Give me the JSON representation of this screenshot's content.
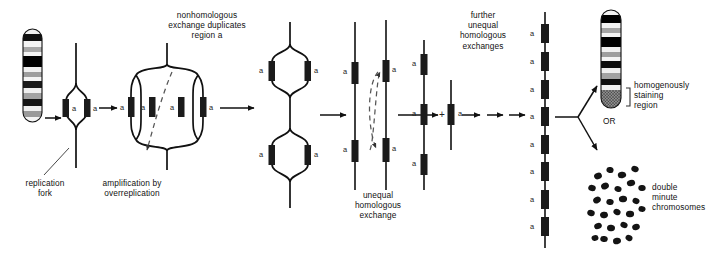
{
  "figure": {
    "type": "biology-process-diagram",
    "background": "#ffffff",
    "ink": "#000000"
  },
  "labels": {
    "replication_fork": "replication\nfork",
    "amplification": "amplification by\noverreplication",
    "nonhomologous": "nonhomologous\nexchange duplicates\nregion a",
    "unequal_exchange": "unequal\nhomologous\nexchange",
    "further_exchanges": "further\nunequal\nhomologous\nexchanges",
    "hsr": "homogenously\nstaining\nregion",
    "or": "OR",
    "double_minutes": "double\nminute\nchromosomes",
    "region_a": "a",
    "plus": "+"
  },
  "stages": [
    {
      "name": "metaphase-chromosome",
      "bands": 14
    },
    {
      "name": "replication-bubble",
      "a_count": 2
    },
    {
      "name": "nonhomologous-exchange",
      "a_count": 4
    },
    {
      "name": "double-bubble",
      "a_count": 4
    },
    {
      "name": "unequal-homologous-exchange",
      "a_count": 4
    },
    {
      "name": "three-copy-chromosome",
      "a_count": 3
    },
    {
      "name": "single-copy-chromosome",
      "a_count": 1
    },
    {
      "name": "amplified-array",
      "a_count": 8
    },
    {
      "name": "hsr-chromosome",
      "bands": 12
    },
    {
      "name": "double-minute-cluster",
      "count": 26
    }
  ],
  "chromosome_bands": [
    {
      "y": 0,
      "h": 5,
      "tone": "light"
    },
    {
      "y": 5,
      "h": 7,
      "tone": "dark"
    },
    {
      "y": 12,
      "h": 6,
      "tone": "light"
    },
    {
      "y": 18,
      "h": 5,
      "tone": "mid"
    },
    {
      "y": 23,
      "h": 4,
      "tone": "light"
    },
    {
      "y": 27,
      "h": 11,
      "tone": "black"
    },
    {
      "y": 38,
      "h": 5,
      "tone": "light"
    },
    {
      "y": 43,
      "h": 5,
      "tone": "mid"
    },
    {
      "y": 48,
      "h": 4,
      "tone": "light"
    },
    {
      "y": 52,
      "h": 7,
      "tone": "dark"
    },
    {
      "y": 59,
      "h": 5,
      "tone": "light"
    },
    {
      "y": 64,
      "h": 6,
      "tone": "mid"
    },
    {
      "y": 70,
      "h": 7,
      "tone": "dark"
    },
    {
      "y": 77,
      "h": 8,
      "tone": "light"
    }
  ],
  "hsr_bands": [
    {
      "y": 0,
      "h": 5,
      "tone": "light"
    },
    {
      "y": 5,
      "h": 7,
      "tone": "black"
    },
    {
      "y": 12,
      "h": 5,
      "tone": "light"
    },
    {
      "y": 17,
      "h": 5,
      "tone": "mid"
    },
    {
      "y": 22,
      "h": 4,
      "tone": "light"
    },
    {
      "y": 26,
      "h": 10,
      "tone": "black"
    },
    {
      "y": 36,
      "h": 5,
      "tone": "light"
    },
    {
      "y": 41,
      "h": 5,
      "tone": "mid"
    },
    {
      "y": 46,
      "h": 4,
      "tone": "light"
    },
    {
      "y": 50,
      "h": 7,
      "tone": "black"
    },
    {
      "y": 57,
      "h": 5,
      "tone": "light"
    },
    {
      "y": 62,
      "h": 6,
      "tone": "mid"
    },
    {
      "y": 68,
      "h": 6,
      "tone": "black"
    },
    {
      "y": 74,
      "h": 5,
      "tone": "light"
    },
    {
      "y": 79,
      "h": 14,
      "tone": "stipple"
    }
  ],
  "double_minutes": [
    {
      "x": 8,
      "y": 14,
      "rx": 4.0,
      "ry": 3.2,
      "rot": -20
    },
    {
      "x": 20,
      "y": 8,
      "rx": 3.6,
      "ry": 3.0,
      "rot": 15
    },
    {
      "x": 32,
      "y": 13,
      "rx": 4.2,
      "ry": 3.2,
      "rot": -10
    },
    {
      "x": 45,
      "y": 7,
      "rx": 3.8,
      "ry": 3.0,
      "rot": 25
    },
    {
      "x": 2,
      "y": 26,
      "rx": 3.8,
      "ry": 3.1,
      "rot": 10
    },
    {
      "x": 15,
      "y": 24,
      "rx": 4.0,
      "ry": 3.3,
      "rot": -25
    },
    {
      "x": 28,
      "y": 27,
      "rx": 3.6,
      "ry": 2.9,
      "rot": 20
    },
    {
      "x": 41,
      "y": 21,
      "rx": 4.2,
      "ry": 3.2,
      "rot": -15
    },
    {
      "x": 52,
      "y": 26,
      "rx": 3.7,
      "ry": 3.0,
      "rot": 5
    },
    {
      "x": 7,
      "y": 38,
      "rx": 4.0,
      "ry": 3.2,
      "rot": -30
    },
    {
      "x": 20,
      "y": 40,
      "rx": 3.7,
      "ry": 3.0,
      "rot": 12
    },
    {
      "x": 33,
      "y": 37,
      "rx": 4.1,
      "ry": 3.3,
      "rot": -8
    },
    {
      "x": 46,
      "y": 39,
      "rx": 3.6,
      "ry": 2.9,
      "rot": 22
    },
    {
      "x": 1,
      "y": 51,
      "rx": 3.8,
      "ry": 3.1,
      "rot": 18
    },
    {
      "x": 14,
      "y": 53,
      "rx": 4.0,
      "ry": 3.2,
      "rot": -12
    },
    {
      "x": 27,
      "y": 50,
      "rx": 3.7,
      "ry": 3.0,
      "rot": 28
    },
    {
      "x": 40,
      "y": 52,
      "rx": 4.1,
      "ry": 3.2,
      "rot": -5
    },
    {
      "x": 52,
      "y": 47,
      "rx": 3.6,
      "ry": 2.9,
      "rot": 14
    },
    {
      "x": 8,
      "y": 64,
      "rx": 3.9,
      "ry": 3.1,
      "rot": -22
    },
    {
      "x": 21,
      "y": 66,
      "rx": 4.0,
      "ry": 3.3,
      "rot": 8
    },
    {
      "x": 34,
      "y": 63,
      "rx": 3.7,
      "ry": 2.9,
      "rot": 20
    },
    {
      "x": 46,
      "y": 65,
      "rx": 3.9,
      "ry": 3.1,
      "rot": -18
    },
    {
      "x": 14,
      "y": 77,
      "rx": 3.8,
      "ry": 3.0,
      "rot": 12
    },
    {
      "x": 27,
      "y": 79,
      "rx": 4.0,
      "ry": 3.2,
      "rot": -9
    },
    {
      "x": 39,
      "y": 76,
      "rx": 3.6,
      "ry": 2.9,
      "rot": 24
    },
    {
      "x": 5,
      "y": 76,
      "rx": 3.5,
      "ry": 2.8,
      "rot": -14
    }
  ]
}
